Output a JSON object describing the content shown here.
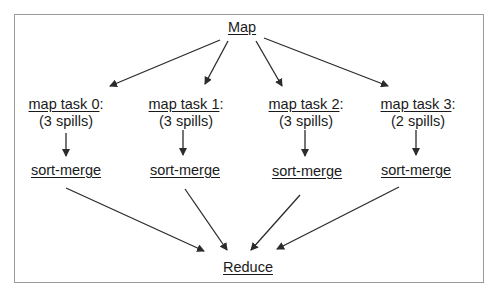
{
  "caption_cut": "MapReduce / Hadoop slide text",
  "diagram": {
    "top": {
      "label": "Map"
    },
    "tasks": [
      {
        "label": "map task 0",
        "suffix": ":",
        "spills": "(3 spills)",
        "merge": "sort-merge"
      },
      {
        "label": "map task 1",
        "suffix": ":",
        "spills": "(3 spills)",
        "merge": "sort-merge"
      },
      {
        "label": "map task 2",
        "suffix": ":",
        "spills": "(3 spills)",
        "merge": "sort-merge"
      },
      {
        "label": "map task 3",
        "suffix": ":",
        "spills": "(2 spills)",
        "merge": "sort-merge"
      }
    ],
    "bottom": {
      "label": "Reduce"
    },
    "colors": {
      "arrow": "#2b2b2b",
      "border": "#9a9a9a"
    }
  }
}
